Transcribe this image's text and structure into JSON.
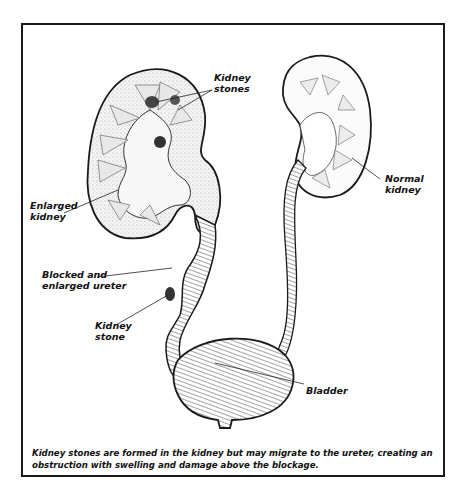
{
  "figure": {
    "labels": {
      "kidney_stones": "Kidney\nstones",
      "enlarged_kidney": "Enlarged\nkidney",
      "blocked_ureter": "Blocked and\nenlarged ureter",
      "kidney_stone": "Kidney\nstone",
      "normal_kidney": "Normal\nkidney",
      "bladder": "Bladder"
    },
    "caption": "Kidney stones are formed in the kidney but may migrate to the ureter, creating an obstruction with swelling and damage above the blockage.",
    "colors": {
      "ink": "#1a1a1a",
      "stipple": "#d9d9d9",
      "stone": "#444444",
      "background": "#ffffff"
    }
  }
}
